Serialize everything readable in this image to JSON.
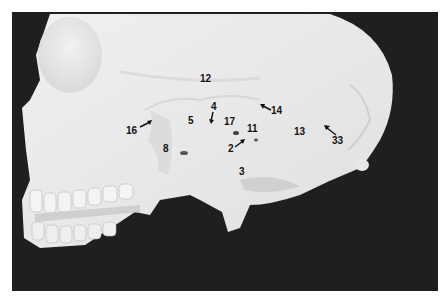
{
  "figure": {
    "background_color": "#1f1f1f",
    "bone_color": "#ebebeb",
    "labels": [
      {
        "id": "12",
        "text": "12",
        "x": 200,
        "y": 74
      },
      {
        "id": "16",
        "text": "16",
        "x": 126,
        "y": 126,
        "arrow": "up-right"
      },
      {
        "id": "5",
        "text": "5",
        "x": 188,
        "y": 116
      },
      {
        "id": "4",
        "text": "4",
        "x": 211,
        "y": 102,
        "arrow": "down"
      },
      {
        "id": "17",
        "text": "17",
        "x": 224,
        "y": 117
      },
      {
        "id": "11",
        "text": "11",
        "x": 247,
        "y": 124
      },
      {
        "id": "14",
        "text": "14",
        "x": 271,
        "y": 106,
        "arrow": "up-left"
      },
      {
        "id": "13",
        "text": "13",
        "x": 294,
        "y": 127
      },
      {
        "id": "33",
        "text": "33",
        "x": 332,
        "y": 136,
        "arrow": "up-left"
      },
      {
        "id": "8",
        "text": "8",
        "x": 163,
        "y": 144
      },
      {
        "id": "2",
        "text": "2",
        "x": 228,
        "y": 144,
        "arrow": "up-right"
      },
      {
        "id": "3",
        "text": "3",
        "x": 239,
        "y": 167
      }
    ]
  }
}
